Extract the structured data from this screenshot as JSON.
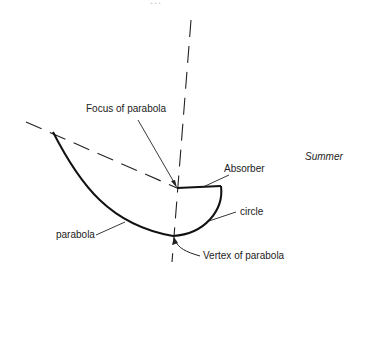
{
  "diagram": {
    "title_faint": "...",
    "labels": {
      "focus": "Focus of parabola",
      "absorber": "Absorber",
      "season": "Summer",
      "circle": "circle",
      "parabola": "parabola",
      "vertex": "Vertex of parabola"
    },
    "colors": {
      "stroke": "#111111",
      "text": "#222222",
      "background": "#ffffff"
    }
  }
}
